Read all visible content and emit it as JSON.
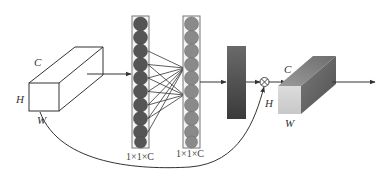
{
  "diagram": {
    "type": "channel-attention-block",
    "input_tensor": {
      "labels": {
        "channels": "C",
        "height": "H",
        "width": "W"
      }
    },
    "fc_layer_1": {
      "label": "1×1×C",
      "neuron_count": 10,
      "neuron_color": "#555555"
    },
    "fc_layer_2": {
      "label": "1×1×C",
      "neuron_count": 10,
      "neuron_color": "#8a8a8a"
    },
    "activation_block": {
      "gradient_top": "#6a6a6a",
      "gradient_bottom": "#3a3a3a"
    },
    "multiply_op": {
      "symbol": "⊗"
    },
    "output_tensor": {
      "labels": {
        "channels": "C",
        "height": "H",
        "width": "W"
      }
    },
    "skip_connection": {
      "from": "input_tensor",
      "to": "multiply_op"
    }
  }
}
